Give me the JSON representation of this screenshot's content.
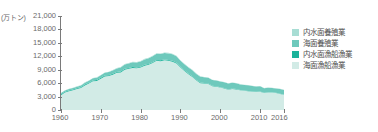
{
  "chart_data": {
    "type": "area",
    "stacked": true,
    "title": "",
    "subtitle": "",
    "xlabel": "(年)",
    "ylabel": "(万トン)",
    "unit": "(万トン)",
    "ylim": [
      0,
      21000
    ],
    "xlim": [
      1960,
      2016
    ],
    "grid": false,
    "legend_position": "right",
    "y_ticks": [
      "0",
      "3,000",
      "6,000",
      "9,000",
      "12,000",
      "15,000",
      "18,000",
      "21,000"
    ],
    "y_tick_values": [
      0,
      3000,
      6000,
      9000,
      12000,
      15000,
      18000,
      21000
    ],
    "x_ticks": [
      "1960",
      "1970",
      "1980",
      "1990",
      "2000",
      "2010",
      "2016"
    ],
    "x_tick_values": [
      1960,
      1970,
      1980,
      1990,
      2000,
      2010,
      2016
    ],
    "x": [
      1960,
      1961,
      1962,
      1963,
      1964,
      1965,
      1966,
      1967,
      1968,
      1969,
      1970,
      1971,
      1972,
      1973,
      1974,
      1975,
      1976,
      1977,
      1978,
      1979,
      1980,
      1981,
      1982,
      1983,
      1984,
      1985,
      1986,
      1987,
      1988,
      1989,
      1990,
      1991,
      1992,
      1993,
      1994,
      1995,
      1996,
      1997,
      1998,
      1999,
      2000,
      2001,
      2002,
      2003,
      2004,
      2005,
      2006,
      2007,
      2008,
      2009,
      2010,
      2011,
      2012,
      2013,
      2014,
      2015,
      2016
    ],
    "series": [
      {
        "name": "海面漁船漁業",
        "color": "#d2ebe6",
        "order": 1,
        "values": [
          3320,
          3900,
          4180,
          4420,
          4680,
          4900,
          5500,
          5900,
          6400,
          6500,
          7000,
          7500,
          7600,
          7900,
          8300,
          8400,
          9000,
          9200,
          9400,
          9300,
          9500,
          9900,
          10100,
          10500,
          11000,
          10900,
          11100,
          11000,
          10800,
          10400,
          9500,
          8700,
          8000,
          7400,
          6600,
          6000,
          5900,
          5800,
          5300,
          5200,
          5000,
          4800,
          4500,
          4700,
          4600,
          4400,
          4300,
          4200,
          4100,
          4000,
          4100,
          3800,
          3900,
          3900,
          3800,
          3600,
          3400
        ]
      },
      {
        "name": "内水面漁船漁業",
        "color": "#1ab39a",
        "order": 2,
        "values": [
          180,
          180,
          180,
          180,
          180,
          180,
          190,
          190,
          190,
          190,
          190,
          190,
          190,
          190,
          190,
          190,
          190,
          190,
          190,
          190,
          190,
          190,
          190,
          190,
          190,
          190,
          180,
          180,
          180,
          170,
          170,
          160,
          150,
          140,
          130,
          120,
          110,
          110,
          100,
          100,
          90,
          90,
          80,
          80,
          70,
          70,
          60,
          60,
          60,
          50,
          50,
          50,
          40,
          40,
          40,
          40,
          40
        ]
      },
      {
        "name": "海面養殖業",
        "color": "#6ec9bc",
        "order": 3,
        "values": [
          280,
          300,
          320,
          340,
          360,
          380,
          420,
          450,
          480,
          520,
          560,
          620,
          680,
          740,
          800,
          880,
          950,
          1000,
          1050,
          1100,
          1150,
          1200,
          1250,
          1300,
          1350,
          1400,
          1430,
          1450,
          1470,
          1440,
          1350,
          1350,
          1340,
          1330,
          1320,
          1310,
          1300,
          1290,
          1280,
          1270,
          1260,
          1300,
          1320,
          1300,
          1280,
          1250,
          1230,
          1250,
          1200,
          1200,
          1150,
          1000,
          1050,
          1000,
          990,
          1070,
          1030
        ]
      },
      {
        "name": "内水面養殖業",
        "color": "#a8ddd4",
        "order": 4,
        "values": [
          40,
          45,
          50,
          55,
          60,
          65,
          70,
          75,
          80,
          85,
          90,
          95,
          100,
          105,
          110,
          115,
          120,
          125,
          128,
          130,
          132,
          134,
          136,
          138,
          140,
          142,
          140,
          138,
          136,
          130,
          120,
          115,
          110,
          105,
          100,
          95,
          90,
          85,
          80,
          78,
          76,
          74,
          72,
          70,
          68,
          66,
          64,
          62,
          60,
          58,
          56,
          54,
          52,
          50,
          48,
          46,
          45
        ]
      }
    ]
  },
  "legend": {
    "items": [
      {
        "label": "内水面養殖業",
        "color": "#a8ddd4"
      },
      {
        "label": "海面養殖業",
        "color": "#6ec9bc"
      },
      {
        "label": "内水面漁船漁業",
        "color": "#1ab39a"
      },
      {
        "label": "海面漁船漁業",
        "color": "#d2ebe6"
      }
    ]
  },
  "axis": {
    "y_unit": "(万トン)",
    "x_unit": "(年)"
  }
}
